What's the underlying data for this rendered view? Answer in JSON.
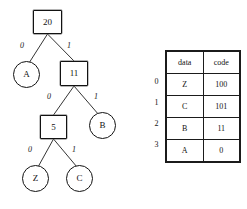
{
  "diagram": {
    "kind": "huffman-coding-tree",
    "colors": {
      "background": "#ffffff",
      "stroke": "#121212",
      "text": "#111111"
    },
    "tree": {
      "nodes": [
        {
          "id": "n20",
          "label": "20",
          "shape": "square",
          "role": "internal",
          "x": 33,
          "y": 10,
          "w": 29,
          "h": 24
        },
        {
          "id": "a",
          "label": "A",
          "shape": "circle",
          "role": "leaf",
          "x": 13,
          "y": 61,
          "w": 27,
          "h": 27
        },
        {
          "id": "n11",
          "label": "11",
          "shape": "square",
          "role": "internal",
          "x": 60,
          "y": 61,
          "w": 28,
          "h": 25
        },
        {
          "id": "n5",
          "label": "5",
          "shape": "square",
          "role": "internal",
          "x": 40,
          "y": 115,
          "w": 27,
          "h": 24
        },
        {
          "id": "b",
          "label": "B",
          "shape": "circle",
          "role": "leaf",
          "x": 89,
          "y": 112,
          "w": 27,
          "h": 27
        },
        {
          "id": "z",
          "label": "Z",
          "shape": "circle",
          "role": "leaf",
          "x": 22,
          "y": 165,
          "w": 27,
          "h": 27
        },
        {
          "id": "c",
          "label": "C",
          "shape": "circle",
          "role": "leaf",
          "x": 66,
          "y": 165,
          "w": 27,
          "h": 27
        }
      ],
      "edges": [
        {
          "from": "n20",
          "to": "a",
          "label": "0",
          "x1": 47.5,
          "y1": 34,
          "x2": 29,
          "y2": 63,
          "lx": 20,
          "ly": 42
        },
        {
          "from": "n20",
          "to": "n11",
          "label": "1",
          "x1": 47.5,
          "y1": 34,
          "x2": 74,
          "y2": 61,
          "lx": 67,
          "ly": 42
        },
        {
          "from": "n11",
          "to": "n5",
          "label": "0",
          "x1": 74,
          "y1": 86,
          "x2": 53.5,
          "y2": 115,
          "lx": 47,
          "ly": 93
        },
        {
          "from": "n11",
          "to": "b",
          "label": "1",
          "x1": 74,
          "y1": 86,
          "x2": 99,
          "y2": 115,
          "lx": 94,
          "ly": 93
        },
        {
          "from": "n5",
          "to": "z",
          "label": "0",
          "x1": 53.5,
          "y1": 139,
          "x2": 38,
          "y2": 167,
          "lx": 28,
          "ly": 146
        },
        {
          "from": "n5",
          "to": "c",
          "label": "1",
          "x1": 53.5,
          "y1": 139,
          "x2": 77,
          "y2": 167,
          "lx": 72,
          "ly": 146
        }
      ]
    }
  },
  "code_table": {
    "headers": [
      "data",
      "code"
    ],
    "row_indices": [
      "0",
      "1",
      "2",
      "3"
    ],
    "rows": [
      {
        "data": "Z",
        "code": "100"
      },
      {
        "data": "C",
        "code": "101"
      },
      {
        "data": "B",
        "code": "11"
      },
      {
        "data": "A",
        "code": "0"
      }
    ]
  }
}
